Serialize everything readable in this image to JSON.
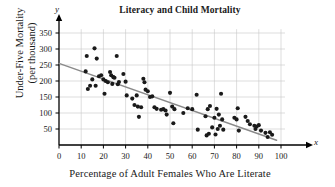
{
  "chart_data": {
    "type": "scatter",
    "title": "Literacy and Child Mortality",
    "xlabel": "Percentage of Adult Females Who Are Literate",
    "ylabel_line1": "Under-Five Mortality",
    "ylabel_line2": "(per thousand)",
    "x_axis_symbol": "x",
    "y_axis_symbol": "y",
    "xlim": [
      0,
      100
    ],
    "ylim": [
      0,
      365
    ],
    "xticks": [
      0,
      10,
      20,
      30,
      40,
      50,
      60,
      70,
      80,
      90,
      100
    ],
    "yticks": [
      50,
      100,
      150,
      200,
      250,
      300,
      350
    ],
    "grid": true,
    "grid_color": "#c8c8c8",
    "point_color": "#1a1a1a",
    "trendline_color": "#8a8a8a",
    "axis_color": "#000000",
    "legend": "none",
    "trendline": {
      "label": "least-squares regression line",
      "x_start": 0,
      "y_start": 255,
      "x_end": 98,
      "y_end": 15
    },
    "points": [
      [
        12,
        230
      ],
      [
        12.5,
        278
      ],
      [
        13,
        175
      ],
      [
        14,
        185
      ],
      [
        15,
        205
      ],
      [
        16,
        302
      ],
      [
        16.5,
        185
      ],
      [
        17,
        270
      ],
      [
        18,
        215
      ],
      [
        19,
        218
      ],
      [
        20,
        205
      ],
      [
        20.5,
        160
      ],
      [
        21,
        200
      ],
      [
        22,
        196
      ],
      [
        23,
        228
      ],
      [
        23.5,
        218
      ],
      [
        24,
        191
      ],
      [
        24.5,
        212
      ],
      [
        25,
        210
      ],
      [
        26,
        278
      ],
      [
        26.5,
        190
      ],
      [
        27,
        197
      ],
      [
        29,
        222
      ],
      [
        30,
        198
      ],
      [
        30.5,
        155
      ],
      [
        33,
        145
      ],
      [
        34,
        125
      ],
      [
        35,
        155
      ],
      [
        35.5,
        120
      ],
      [
        36,
        88
      ],
      [
        37,
        118
      ],
      [
        38,
        207
      ],
      [
        38.5,
        196
      ],
      [
        39,
        173
      ],
      [
        40,
        168
      ],
      [
        41,
        150
      ],
      [
        42,
        152
      ],
      [
        43,
        118
      ],
      [
        44,
        113
      ],
      [
        46,
        110
      ],
      [
        47,
        112
      ],
      [
        48,
        108
      ],
      [
        48.5,
        95
      ],
      [
        50,
        163
      ],
      [
        51,
        120
      ],
      [
        51.5,
        68
      ],
      [
        52,
        112
      ],
      [
        56,
        100
      ],
      [
        58,
        115
      ],
      [
        60,
        112
      ],
      [
        62,
        157
      ],
      [
        62.5,
        48
      ],
      [
        66,
        90
      ],
      [
        66.5,
        30
      ],
      [
        67,
        112
      ],
      [
        67.5,
        35
      ],
      [
        68,
        122
      ],
      [
        69,
        55
      ],
      [
        70,
        85
      ],
      [
        70.5,
        33
      ],
      [
        71,
        113
      ],
      [
        71.5,
        50
      ],
      [
        72,
        95
      ],
      [
        72.5,
        60
      ],
      [
        73,
        160
      ],
      [
        73.5,
        80
      ],
      [
        74,
        48
      ],
      [
        79,
        85
      ],
      [
        80,
        80
      ],
      [
        80.5,
        115
      ],
      [
        81,
        45
      ],
      [
        84,
        88
      ],
      [
        85,
        75
      ],
      [
        86,
        65
      ],
      [
        88,
        60
      ],
      [
        88.5,
        50
      ],
      [
        89,
        58
      ],
      [
        90,
        62
      ],
      [
        91,
        45
      ],
      [
        93,
        38
      ],
      [
        94,
        25
      ],
      [
        95,
        40
      ],
      [
        96,
        32
      ]
    ]
  }
}
